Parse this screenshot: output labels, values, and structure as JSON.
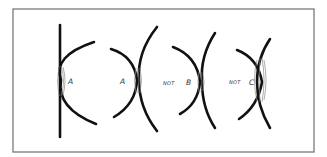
{
  "figure": {
    "frame_color": "#7a7a7a",
    "stroke_color": "#111111",
    "groups": [
      {
        "id": "group-1",
        "label": "A",
        "prefix": ""
      },
      {
        "id": "group-2",
        "label": "A",
        "prefix": ""
      },
      {
        "id": "group-3",
        "label": "B",
        "prefix": "NOT"
      },
      {
        "id": "group-4",
        "label": "C",
        "prefix": "NOT"
      }
    ]
  }
}
